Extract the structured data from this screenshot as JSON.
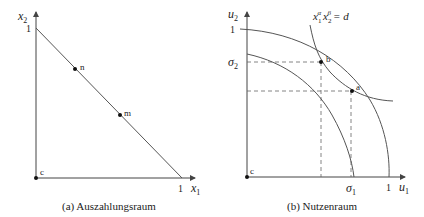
{
  "panel_a": {
    "caption": "(a)  Auszahlungsraum",
    "x_axis_label": "x",
    "x_axis_sub": "1",
    "y_axis_label": "x",
    "y_axis_sub": "2",
    "x_tick": "1",
    "y_tick": "1",
    "origin_label": "c",
    "points": [
      {
        "label": "n"
      },
      {
        "label": "m"
      }
    ]
  },
  "panel_b": {
    "caption": "(b)  Nutzenraum",
    "x_axis_label": "u",
    "x_axis_sub": "1",
    "y_axis_label": "u",
    "y_axis_sub": "2",
    "x_tick_sigma": "σ",
    "x_tick_sigma_sub": "1",
    "x_tick_one": "1",
    "y_tick_sigma": "σ",
    "y_tick_sigma_sub": "2",
    "y_tick_one": "1",
    "origin_label": "c",
    "curve_label": {
      "x": "x",
      "sub1": "1",
      "sup1": "α",
      "x2": "x",
      "sub2": "2",
      "sup2": "β",
      "rhs": "= d"
    },
    "points": [
      {
        "label": "b"
      },
      {
        "label": "a"
      }
    ]
  },
  "colors": {
    "line": "#555555",
    "axis": "#444444",
    "point": "#111111"
  }
}
